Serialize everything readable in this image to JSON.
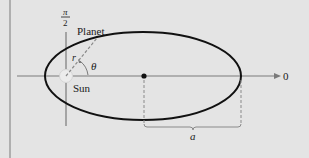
{
  "diagram": {
    "labels": {
      "planet": "Planet",
      "sun": "Sun",
      "theta": "θ",
      "r": "r",
      "polar_axis": "0",
      "half_pi_numerator": "π",
      "half_pi_denominator": "2",
      "semi_major_axis": "a"
    },
    "colors": {
      "background": "#e4e4e4",
      "ellipse": "#111111",
      "axis": "#7a7a7a",
      "dashed": "#8a8a8a",
      "border": "#8c8c8c"
    }
  }
}
